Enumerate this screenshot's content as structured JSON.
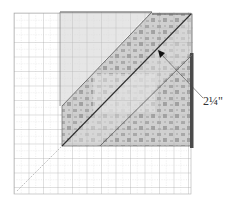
{
  "figure": {
    "measurement_label": "2¼\"",
    "colors": {
      "grid_line": "#b8b8b8",
      "grid_major": "#9a9a9a",
      "light_fabric": "#e6e6e6",
      "print_fabric": "#c9c9c9",
      "print_spots": "#9e9e9e",
      "dark_edge": "#555555",
      "diagonal_line": "#3a3a3a",
      "arrow": "#111111",
      "label_text": "#333333"
    }
  }
}
